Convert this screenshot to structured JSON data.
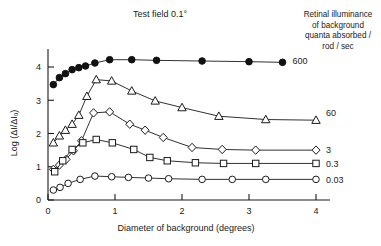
{
  "chart_data": {
    "type": "line",
    "title": "Test field  0.1°",
    "xlabel": "Diameter of background (degrees)",
    "ylabel": "Log (ΔI/ΔIₒ)",
    "xlim": [
      0,
      4.35
    ],
    "ylim": [
      0,
      4.55
    ],
    "xticks": [
      0,
      1,
      2,
      3,
      4
    ],
    "yticks": [
      0,
      1,
      2,
      3,
      4
    ],
    "xticklabels": [
      "0",
      "1",
      "2",
      "3",
      "4"
    ],
    "yticklabels": [
      "0",
      "1",
      "2",
      "3",
      "4"
    ],
    "grid": false,
    "legend_position": "right",
    "legend_title_lines": [
      "Retinal illuminance",
      "of background",
      "quanta absorbed /",
      "rod / sec"
    ],
    "series": [
      {
        "name": "600",
        "marker": "filled-circle",
        "label": "600",
        "label_y": 4.18,
        "x": [
          0.08,
          0.17,
          0.26,
          0.36,
          0.46,
          0.56,
          0.7,
          0.92,
          1.25,
          1.62,
          2.3,
          3.0,
          3.5
        ],
        "y": [
          3.47,
          3.68,
          3.8,
          3.92,
          3.98,
          4.03,
          4.12,
          4.22,
          4.22,
          4.2,
          4.18,
          4.16,
          4.14
        ]
      },
      {
        "name": "60",
        "marker": "open-triangle",
        "label": "60",
        "label_y": 2.62,
        "x": [
          0.08,
          0.17,
          0.26,
          0.36,
          0.46,
          0.58,
          0.72,
          0.95,
          1.25,
          1.6,
          2.0,
          2.55,
          3.25,
          4.0
        ],
        "y": [
          1.72,
          1.93,
          2.1,
          2.28,
          2.55,
          3.12,
          3.62,
          3.58,
          3.28,
          2.98,
          2.78,
          2.52,
          2.42,
          2.4
        ]
      },
      {
        "name": "3",
        "marker": "open-diamond",
        "label": "3",
        "label_y": 1.52,
        "x": [
          0.08,
          0.17,
          0.27,
          0.38,
          0.5,
          0.68,
          0.92,
          1.22,
          1.45,
          1.72,
          2.15,
          2.6,
          3.1,
          4.0
        ],
        "y": [
          0.92,
          1.05,
          1.22,
          1.48,
          1.78,
          2.62,
          2.65,
          2.28,
          2.1,
          1.88,
          1.58,
          1.52,
          1.5,
          1.5
        ]
      },
      {
        "name": "0.3",
        "marker": "open-square",
        "label": "0.3",
        "label_y": 1.08,
        "x": [
          0.1,
          0.22,
          0.36,
          0.52,
          0.72,
          0.96,
          1.28,
          1.52,
          1.78,
          2.2,
          2.62,
          3.1,
          4.0
        ],
        "y": [
          0.85,
          1.18,
          1.52,
          1.72,
          1.82,
          1.72,
          1.52,
          1.28,
          1.18,
          1.12,
          1.1,
          1.1,
          1.1
        ]
      },
      {
        "name": "0.03",
        "marker": "open-circle",
        "label": "0.03",
        "label_y": 0.62,
        "x": [
          0.08,
          0.18,
          0.3,
          0.48,
          0.7,
          0.95,
          1.2,
          1.5,
          1.8,
          2.3,
          2.75,
          3.25,
          4.0
        ],
        "y": [
          0.3,
          0.38,
          0.5,
          0.62,
          0.72,
          0.7,
          0.68,
          0.66,
          0.64,
          0.62,
          0.62,
          0.62,
          0.62
        ]
      }
    ]
  }
}
